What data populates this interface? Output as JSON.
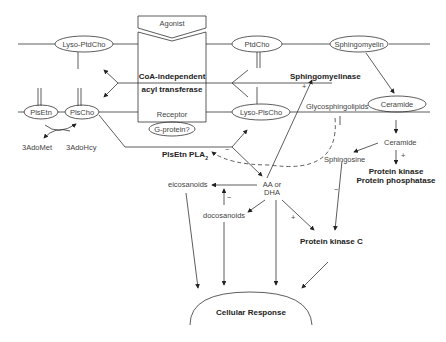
{
  "diagram": {
    "nodes": {
      "agonist": "Agonist",
      "lyso_ptdcho": "Lyso-PtdCho",
      "ptdcho": "PtdCho",
      "sphingomyelin": "Sphingomyelin",
      "coa_line1": "CoA-independent",
      "coa_line2": "acyl transferase",
      "sphingomyelinase": "Sphingomyelinase",
      "plsetn": "PlsEtn",
      "plscho": "PlsCho",
      "receptor": "Receptor",
      "lyso_plscho": "Lyso-PlsCho",
      "glycosphingolipids": "Glycosphingolipids",
      "ceramide_oval": "Ceramide",
      "g_protein": "G-protein?",
      "adomet": "3AdoMet",
      "adohcy": "3AdoHcy",
      "plsetn_pla2": "PlsEtn PLA",
      "plsetn_pla2_sub": "2",
      "ceramide": "Ceramide",
      "sphingosine": "Sphingosine",
      "pk_line1": "Protein kinase",
      "pk_line2": "Protein phosphatase",
      "eicosanoids": "eicosanoids",
      "aa_line1": "AA or",
      "aa_line2": "DHA",
      "docosanoids": "docosanoids",
      "pkc": "Protein kinase C",
      "cellular_response": "Cellular Response"
    },
    "signs": {
      "plus_smase": "+",
      "minus_pla2": "−",
      "minus_doco": "−",
      "plus_ceramide": "+",
      "minus_sphingosine": "−",
      "plus_pkc": "+"
    },
    "colors": {
      "line": "#333333",
      "text": "#444444",
      "bold_text": "#222222"
    }
  }
}
